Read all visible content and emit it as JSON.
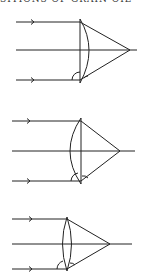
{
  "caption": "SITIONS OF GRAIN OIL",
  "colors": {
    "stroke": "#222222",
    "background": "#ffffff"
  },
  "diagrams": [
    {
      "id": "plano-convex-curved-right",
      "lens_type": "plano-convex",
      "curved_side": "right",
      "rays": 3
    },
    {
      "id": "plano-convex-curved-left",
      "lens_type": "plano-convex",
      "curved_side": "left",
      "rays": 3
    },
    {
      "id": "biconvex",
      "lens_type": "biconvex",
      "curved_side": "both",
      "rays": 3
    }
  ]
}
